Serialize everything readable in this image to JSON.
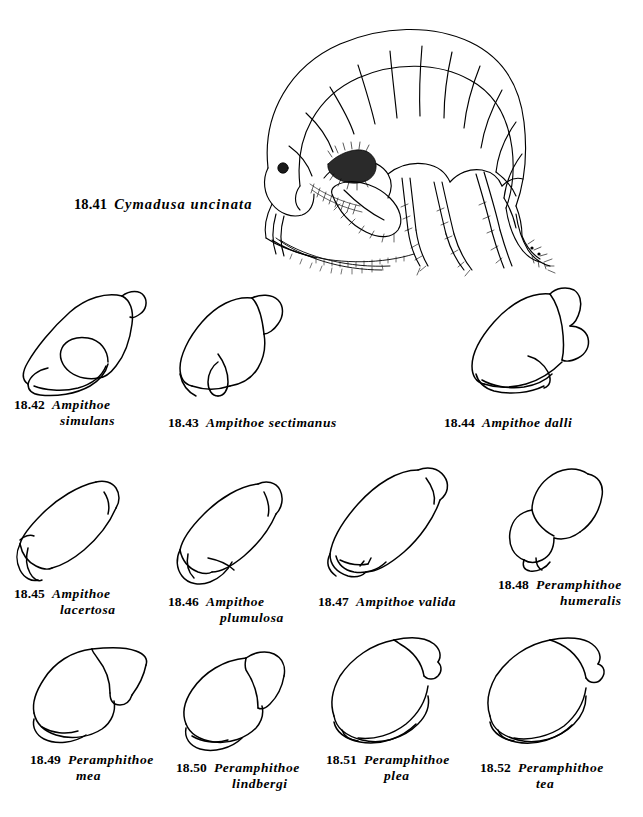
{
  "plate": {
    "background_color": "#ffffff",
    "ink_color": "#000000",
    "figures": [
      {
        "id": "18.41",
        "number": "18.41",
        "species": "Cymadusa uncinata",
        "subject": "whole-body-amphipod",
        "caption_lines": [
          "Cymadusa uncinata"
        ]
      },
      {
        "id": "18.42",
        "number": "18.42",
        "species": "Ampithoe simulans",
        "subject": "gnathopod",
        "caption_lines": [
          "Ampithoe",
          "simulans"
        ]
      },
      {
        "id": "18.43",
        "number": "18.43",
        "species": "Ampithoe sectimanus",
        "subject": "gnathopod",
        "caption_lines": [
          "Ampithoe  sectimanus"
        ]
      },
      {
        "id": "18.44",
        "number": "18.44",
        "species": "Ampithoe dalli",
        "subject": "gnathopod",
        "caption_lines": [
          "Ampithoe  dalli"
        ]
      },
      {
        "id": "18.45",
        "number": "18.45",
        "species": "Ampithoe lacertosa",
        "subject": "gnathopod",
        "caption_lines": [
          "Ampithoe",
          "lacertosa"
        ]
      },
      {
        "id": "18.46",
        "number": "18.46",
        "species": "Ampithoe plumulosa",
        "subject": "gnathopod",
        "caption_lines": [
          "Ampithoe",
          "plumulosa"
        ]
      },
      {
        "id": "18.47",
        "number": "18.47",
        "species": "Ampithoe valida",
        "subject": "gnathopod",
        "caption_lines": [
          "Ampithoe  valida"
        ]
      },
      {
        "id": "18.48",
        "number": "18.48",
        "species": "Peramphithoe humeralis",
        "subject": "gnathopod",
        "caption_lines": [
          "Peramphithoe",
          "humeralis"
        ]
      },
      {
        "id": "18.49",
        "number": "18.49",
        "species": "Peramphithoe mea",
        "subject": "gnathopod",
        "caption_lines": [
          "Peramphithoe",
          "mea"
        ]
      },
      {
        "id": "18.50",
        "number": "18.50",
        "species": "Peramphithoe lindbergi",
        "subject": "gnathopod",
        "caption_lines": [
          "Peramphithoe",
          "lindbergi"
        ]
      },
      {
        "id": "18.51",
        "number": "18.51",
        "species": "Peramphithoe plea",
        "subject": "gnathopod",
        "caption_lines": [
          "Peramphithoe",
          "plea"
        ]
      },
      {
        "id": "18.52",
        "number": "18.52",
        "species": "Peramphithoe tea",
        "subject": "gnathopod",
        "caption_lines": [
          "Peramphithoe",
          "tea"
        ]
      }
    ]
  }
}
